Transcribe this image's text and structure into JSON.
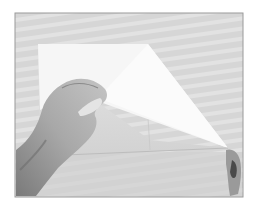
{
  "image": {
    "description": "Grayscale photo of two hands folding a square sheet of paper on a striped surface",
    "colors": {
      "page_bg": "#ffffff",
      "frame_border": "#9a9a9a",
      "surface": "#d6d6d6",
      "surface_stripe": "#e4e4e4",
      "paper": "#f6f6f6",
      "paper_shadow": "#dcdcdc",
      "flap": "#fbfbfb",
      "skin_light": "#b8b8b8",
      "skin_mid": "#9c9c9c",
      "skin_dark": "#6e6e6e",
      "finger_dark": "#4a4a4a"
    }
  }
}
